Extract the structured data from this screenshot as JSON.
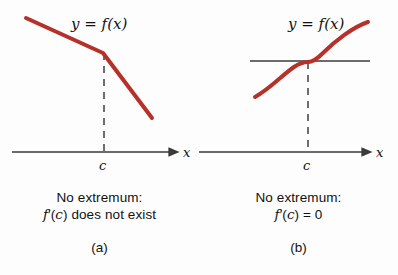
{
  "figure": {
    "background": "#fdfdfd",
    "curve_color": "#b5312a",
    "axis_color": "#3a3a3a",
    "text_color": "#111111"
  },
  "panels": [
    {
      "id": "a",
      "function_label": {
        "y": "y",
        "equals": "=",
        "f": "f",
        "open": "(",
        "x": "x",
        "close": ")",
        "full": "y = f(x)"
      },
      "axis_label_x": "x",
      "tick_label_c": "c",
      "caption_line1": "No extremum:",
      "caption_line2_parts": {
        "f": "f",
        "prime": "′",
        "open": "(",
        "c": "c",
        "close": ")",
        "rest": "does not exist"
      },
      "caption_line2_full": "f′(c) does not exist",
      "index_label": "(a)",
      "curve_type": "piecewise-linear-kink",
      "curve_points": [
        [
          26,
          18
        ],
        [
          103,
          53
        ],
        [
          152,
          118
        ]
      ],
      "kink_at_c": true,
      "has_tangent_line": false,
      "dashed_line_x": 104,
      "dashed_line_from_y": 53,
      "dashed_line_to_y": 152,
      "axis_y": 152,
      "axis_x_start": 12,
      "axis_x_end": 178
    },
    {
      "id": "b",
      "function_label": {
        "y": "y",
        "equals": "=",
        "f": "f",
        "open": "(",
        "x": "x",
        "close": ")",
        "full": "y = f(x)"
      },
      "axis_label_x": "x",
      "tick_label_c": "c",
      "caption_line1": "No extremum:",
      "caption_line2_parts": {
        "f": "f",
        "prime": "′",
        "open": "(",
        "c": "c",
        "close": ")",
        "rest": "= 0"
      },
      "caption_line2_full": "f′(c) = 0",
      "index_label": "(b)",
      "curve_type": "cubic-inflection",
      "curve_points": [
        [
          56,
          97
        ],
        [
          86,
          80
        ],
        [
          109,
          62
        ],
        [
          132,
          44
        ],
        [
          169,
          22
        ]
      ],
      "kink_at_c": false,
      "has_tangent_line": true,
      "tangent_y": 61,
      "tangent_x_start": 51,
      "tangent_x_end": 171,
      "dashed_line_x": 109,
      "dashed_line_from_y": 62,
      "dashed_line_to_y": 152,
      "axis_y": 152,
      "axis_x_start": 0,
      "axis_x_end": 172
    }
  ]
}
